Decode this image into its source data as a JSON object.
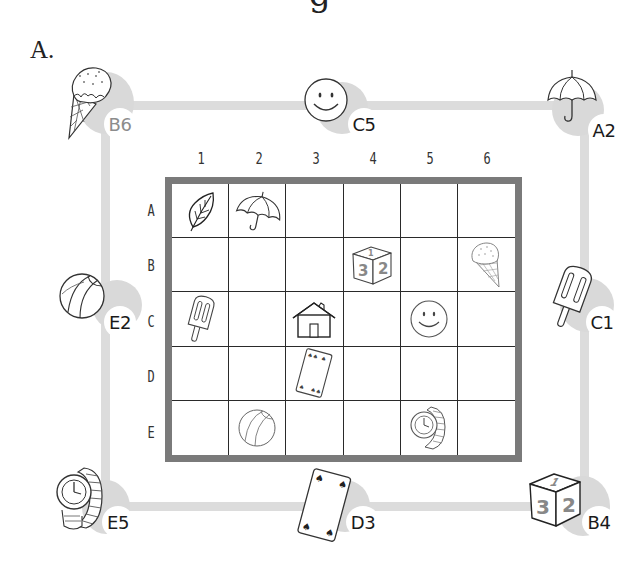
{
  "heading_partial": "g",
  "part_label": "A.",
  "grid": {
    "columns": [
      "1",
      "2",
      "3",
      "4",
      "5",
      "6"
    ],
    "rows": [
      "A",
      "B",
      "C",
      "D",
      "E"
    ],
    "items": [
      {
        "row": "A",
        "col": "1",
        "icon": "leaf-icon"
      },
      {
        "row": "A",
        "col": "2",
        "icon": "umbrella-icon"
      },
      {
        "row": "B",
        "col": "4",
        "icon": "dice-icon"
      },
      {
        "row": "B",
        "col": "6",
        "icon": "ice-cream-icon"
      },
      {
        "row": "C",
        "col": "1",
        "icon": "popsicle-icon"
      },
      {
        "row": "C",
        "col": "3",
        "icon": "house-icon"
      },
      {
        "row": "C",
        "col": "5",
        "icon": "smiley-icon"
      },
      {
        "row": "D",
        "col": "3",
        "icon": "playing-card-icon"
      },
      {
        "row": "E",
        "col": "2",
        "icon": "beach-ball-icon"
      },
      {
        "row": "E",
        "col": "5",
        "icon": "wristwatch-icon"
      }
    ]
  },
  "perimeter": [
    {
      "position": "top-left",
      "icon": "ice-cream-icon",
      "label": "B6",
      "label_style": "light"
    },
    {
      "position": "top-center",
      "icon": "smiley-icon",
      "label": "C5"
    },
    {
      "position": "top-right",
      "icon": "umbrella-icon",
      "label": "A2"
    },
    {
      "position": "left-middle",
      "icon": "beach-ball-icon",
      "label": "E2"
    },
    {
      "position": "right-middle",
      "icon": "popsicle-icon",
      "label": "C1"
    },
    {
      "position": "bottom-left",
      "icon": "wristwatch-icon",
      "label": "E5"
    },
    {
      "position": "bottom-center",
      "icon": "playing-card-icon",
      "label": "D3"
    },
    {
      "position": "bottom-right",
      "icon": "dice-icon",
      "label": "B4"
    }
  ],
  "dice_faces": {
    "top": "1",
    "left": "3",
    "right": "2"
  },
  "colors": {
    "track": "#dcdcdc",
    "shadow": "#d9d9d9",
    "board_frame": "#7a7a7a",
    "grid_line": "#2a2a2a"
  }
}
